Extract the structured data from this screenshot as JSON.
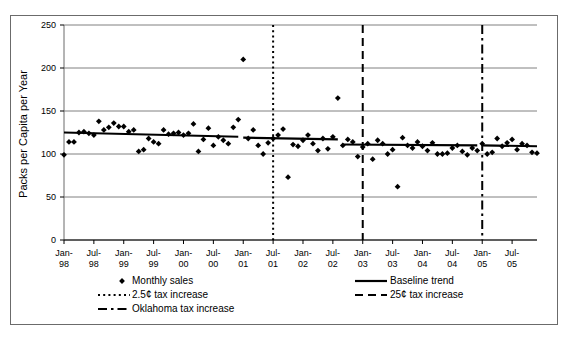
{
  "chart_data": {
    "type": "scatter",
    "title": "",
    "xlabel": "",
    "ylabel": "Packs per Capita per Year",
    "ylim": [
      0,
      250
    ],
    "yticks": [
      0,
      50,
      100,
      150,
      200,
      250
    ],
    "grid": true,
    "legend_position": "bottom",
    "xtick_labels": [
      "Jan-\n98",
      "Jul-\n98",
      "Jan-\n99",
      "Jul-\n99",
      "Jan-\n00",
      "Jul-\n00",
      "Jan-\n01",
      "Jul-\n01",
      "Jan-\n02",
      "Jul-\n02",
      "Jan-\n03",
      "Jul-\n03",
      "Jan-\n04",
      "Jul-\n04",
      "Jan-\n05",
      "Jul-\n05"
    ],
    "xtick_months": [
      "Jan-98",
      "Jul-98",
      "Jan-99",
      "Jul-99",
      "Jan-00",
      "Jul-00",
      "Jan-01",
      "Jul-01",
      "Jan-02",
      "Jul-02",
      "Jan-03",
      "Jul-03",
      "Jan-04",
      "Jul-04",
      "Jan-05",
      "Jul-05"
    ],
    "x_start": "Jan-98",
    "x_end": "Dec-05",
    "n_months": 96,
    "series": [
      {
        "name": "Monthly sales",
        "type": "scatter",
        "marker": "diamond",
        "color": "#000000",
        "values": [
          99,
          114,
          114,
          125,
          126,
          124,
          122,
          138,
          128,
          131,
          136,
          132,
          132,
          126,
          128,
          103,
          105,
          118,
          114,
          112,
          128,
          123,
          124,
          125,
          122,
          124,
          135,
          103,
          117,
          130,
          110,
          120,
          116,
          112,
          131,
          140,
          210,
          118,
          128,
          110,
          100,
          113,
          118,
          122,
          129,
          73,
          111,
          109,
          116,
          122,
          112,
          104,
          118,
          106,
          120,
          165,
          110,
          117,
          114,
          97,
          108,
          112,
          94,
          116,
          112,
          100,
          105,
          62,
          119,
          110,
          107,
          114,
          109,
          104,
          113,
          100,
          100,
          101,
          107,
          110,
          103,
          99,
          107,
          104,
          112,
          100,
          102,
          118,
          109,
          113,
          117,
          105,
          112,
          110,
          102,
          101
        ]
      },
      {
        "name": "Baseline trend",
        "type": "line",
        "style": "solid",
        "color": "#000000",
        "segments": [
          {
            "from_index": 0,
            "to_index": 35,
            "from_value": 125,
            "to_value": 120
          },
          {
            "from_index": 36,
            "to_index": 55,
            "from_value": 119,
            "to_value": 117
          },
          {
            "from_index": 56,
            "to_index": 83,
            "from_value": 111,
            "to_value": 110
          },
          {
            "from_index": 84,
            "to_index": 95,
            "from_value": 110,
            "to_value": 109
          }
        ]
      }
    ],
    "vlines": [
      {
        "name": "2.5¢ tax increase",
        "at": "Jul-01",
        "index": 42,
        "style": "dotted"
      },
      {
        "name": "25¢ tax increase",
        "at": "Jan-03",
        "index": 60,
        "style": "dashed"
      },
      {
        "name": "Oklahoma tax increase",
        "at": "Jan-05",
        "index": 84,
        "style": "dashdot"
      }
    ],
    "legend": [
      {
        "label": "Monthly sales",
        "marker": "diamond"
      },
      {
        "label": "2.5¢ tax increase",
        "marker": "dotted-line"
      },
      {
        "label": "Oklahoma tax increase",
        "marker": "dashdot-line"
      },
      {
        "label": "Baseline trend",
        "marker": "solid-line"
      },
      {
        "label": "25¢ tax increase",
        "marker": "dashed-line"
      }
    ]
  }
}
